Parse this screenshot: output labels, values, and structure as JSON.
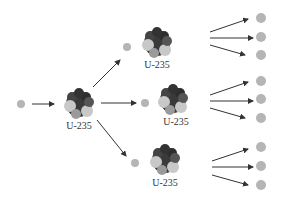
{
  "diagram": {
    "colors": {
      "neutron": "#b5b5b5",
      "nucleus_dark": "#3a3a3a",
      "nucleus_light": "#c8c8c8",
      "arrow": "#333333"
    },
    "nuclei": [
      {
        "id": "n1",
        "label": "U-235",
        "x": 79,
        "y": 108
      },
      {
        "id": "n2",
        "label": "U-235",
        "x": 155,
        "y": 46
      },
      {
        "id": "n3",
        "label": "U-235",
        "x": 173,
        "y": 103
      },
      {
        "id": "n4",
        "label": "U-235",
        "x": 164,
        "y": 162
      }
    ],
    "neutrons": [
      {
        "x": 21,
        "y": 104
      },
      {
        "x": 127,
        "y": 47
      },
      {
        "x": 145,
        "y": 103
      },
      {
        "x": 135,
        "y": 163
      },
      {
        "x": 260,
        "y": 18
      },
      {
        "x": 260,
        "y": 36
      },
      {
        "x": 260,
        "y": 54
      },
      {
        "x": 260,
        "y": 81
      },
      {
        "x": 260,
        "y": 99
      },
      {
        "x": 260,
        "y": 117
      },
      {
        "x": 260,
        "y": 147
      },
      {
        "x": 260,
        "y": 166
      },
      {
        "x": 260,
        "y": 185
      }
    ]
  }
}
